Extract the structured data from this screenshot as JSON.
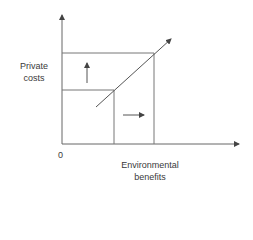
{
  "diagram": {
    "type": "economics-diagram",
    "y_axis_label_line1": "Private",
    "y_axis_label_line2": "costs",
    "x_axis_label_line1": "Environmental",
    "x_axis_label_line2": "benefits",
    "origin_label": "0",
    "line_color": "#555555",
    "elements": [
      {
        "kind": "axis",
        "name": "y-axis",
        "direction": "up"
      },
      {
        "kind": "axis",
        "name": "x-axis",
        "direction": "right"
      },
      {
        "kind": "line",
        "name": "cost-benefit-curve",
        "direction": "up-right",
        "arrow": true
      },
      {
        "kind": "guide",
        "name": "lower-horizontal-guide"
      },
      {
        "kind": "guide",
        "name": "upper-horizontal-guide"
      },
      {
        "kind": "guide",
        "name": "lower-vertical-guide"
      },
      {
        "kind": "guide",
        "name": "upper-vertical-guide"
      },
      {
        "kind": "arrow",
        "name": "cost-increase-arrow",
        "direction": "up"
      },
      {
        "kind": "arrow",
        "name": "benefit-increase-arrow",
        "direction": "right"
      }
    ]
  }
}
